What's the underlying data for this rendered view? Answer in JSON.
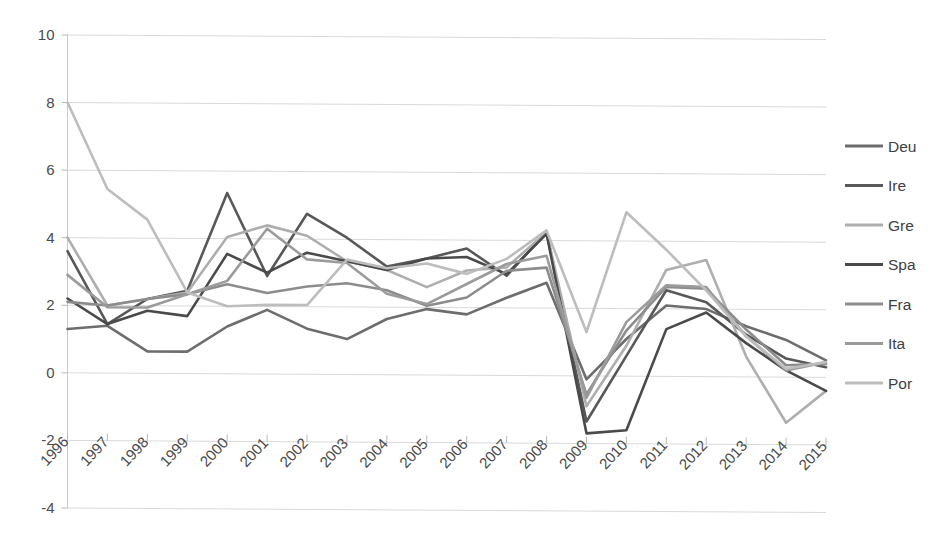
{
  "chart_data": {
    "type": "line",
    "title": "",
    "subtitle": "",
    "xlabel": "",
    "ylabel": "",
    "grid": true,
    "legend_position": "right",
    "ylim": [
      -4,
      10
    ],
    "yticks": [
      "10",
      "8",
      "6",
      "4",
      "2",
      "0",
      "-2",
      "-4"
    ],
    "ytick_values": [
      10,
      8,
      6,
      4,
      2,
      0,
      -2,
      -4
    ],
    "categories": [
      "1996",
      "1997",
      "1998",
      "1999",
      "2000",
      "2001",
      "2002",
      "2003",
      "2004",
      "2005",
      "2006",
      "2007",
      "2008",
      "2009",
      "2010",
      "2011",
      "2012",
      "2013",
      "2014",
      "2015"
    ],
    "series": [
      {
        "name": "Deu",
        "color": "#6d6d6d",
        "values": [
          1.3,
          1.4,
          0.65,
          0.65,
          1.4,
          1.9,
          1.35,
          1.05,
          1.65,
          1.95,
          1.8,
          2.3,
          2.75,
          -0.1,
          1.1,
          2.1,
          2.0,
          1.5,
          1.1,
          0.5
        ]
      },
      {
        "name": "Ire",
        "color": "#585858",
        "values": [
          3.6,
          1.45,
          2.2,
          2.45,
          5.35,
          2.9,
          4.75,
          4.05,
          3.2,
          3.45,
          3.75,
          2.95,
          4.25,
          -1.35,
          0.6,
          2.55,
          2.2,
          1.25,
          0.55,
          0.3
        ]
      },
      {
        "name": "Gre",
        "color": "#aeaeae",
        "values": [
          4.0,
          2.0,
          2.2,
          2.4,
          4.05,
          4.4,
          4.1,
          3.35,
          3.1,
          2.6,
          3.1,
          3.2,
          4.25,
          -0.9,
          0.9,
          3.15,
          3.45,
          0.6,
          -1.35,
          -0.4
        ]
      },
      {
        "name": "Spa",
        "color": "#4a4a4a",
        "values": [
          2.2,
          1.45,
          1.85,
          1.7,
          3.55,
          3.0,
          3.6,
          3.35,
          3.1,
          3.45,
          3.5,
          3.0,
          4.2,
          -1.7,
          -1.6,
          1.4,
          1.9,
          1.0,
          0.2,
          -0.4
        ]
      },
      {
        "name": "Fra",
        "color": "#8c8c8c",
        "values": [
          2.1,
          2.0,
          2.2,
          2.35,
          2.65,
          2.4,
          2.6,
          2.7,
          2.5,
          2.05,
          2.3,
          3.1,
          3.2,
          -0.55,
          1.35,
          2.65,
          2.6,
          1.4,
          0.35,
          0.4
        ]
      },
      {
        "name": "Ita",
        "color": "#9b9b9b",
        "values": [
          2.9,
          1.95,
          1.95,
          2.35,
          2.75,
          4.3,
          3.4,
          3.3,
          2.4,
          2.1,
          2.7,
          3.3,
          3.55,
          -0.65,
          1.6,
          2.7,
          2.65,
          1.2,
          0.2,
          0.45
        ]
      },
      {
        "name": "Por",
        "color": "#bdbdbd",
        "values": [
          8.0,
          5.45,
          4.55,
          2.4,
          2.0,
          2.05,
          2.05,
          3.4,
          3.15,
          3.3,
          3.0,
          3.45,
          4.3,
          1.3,
          4.85,
          3.75,
          2.55,
          1.2,
          0.25,
          0.45
        ]
      }
    ]
  },
  "legend": {
    "items": [
      {
        "label": "Deu"
      },
      {
        "label": "Ire"
      },
      {
        "label": "Gre"
      },
      {
        "label": "Spa"
      },
      {
        "label": "Fra"
      },
      {
        "label": "Ita"
      },
      {
        "label": "Por"
      }
    ]
  }
}
